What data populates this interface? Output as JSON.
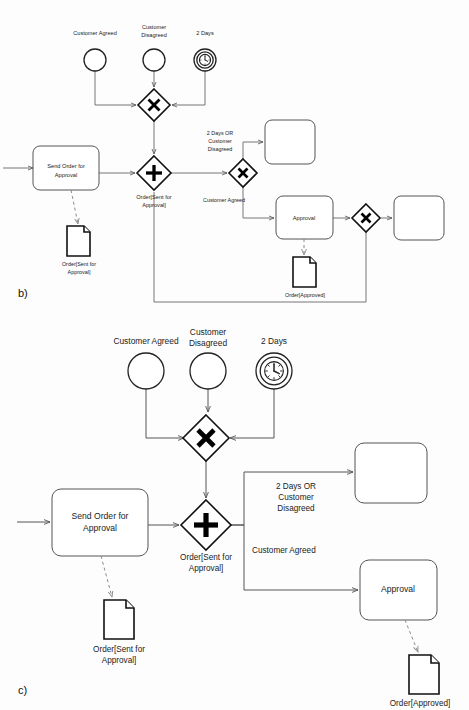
{
  "page": {
    "background_color": "#fdfdfd",
    "stroke_color": "#555555",
    "accent_color": "#111111"
  },
  "figures": [
    {
      "id": "b",
      "caption": "b)",
      "scale": "small",
      "events": [
        {
          "name": "customer-agreed-event",
          "label": "Customer Agreed",
          "type": "none",
          "cx": 95,
          "cy": 60,
          "r": 11,
          "label_x": 95,
          "label_y": 34
        },
        {
          "name": "customer-disagreed-event",
          "label_line1": "Customer",
          "label_line2": "Disagreed",
          "type": "none",
          "cx": 154,
          "cy": 60,
          "r": 11,
          "label_x": 154,
          "label_y": 28
        },
        {
          "name": "two-days-timer-event",
          "label": "2 Days",
          "type": "timer",
          "cx": 205,
          "cy": 60,
          "r": 11,
          "label_x": 205,
          "label_y": 34
        }
      ],
      "gateways": [
        {
          "name": "merge-xor-gateway",
          "type": "exclusive",
          "cx": 154,
          "cy": 105,
          "half": 16
        },
        {
          "name": "split-and-gateway",
          "type": "parallel",
          "cx": 154,
          "cy": 173,
          "half": 17,
          "label_line1": "Order[Sent for",
          "label_line2": "Approval]",
          "label_x": 154,
          "label_y": 194
        },
        {
          "name": "decision-xor-gateway",
          "type": "exclusive",
          "cx": 243,
          "cy": 173,
          "half": 14
        },
        {
          "name": "join-xor-gateway",
          "type": "exclusive",
          "cx": 366,
          "cy": 218,
          "half": 14
        }
      ],
      "tasks": [
        {
          "name": "send-order-task",
          "label_line1": "Send Order for",
          "label_line2": "Approval",
          "x": 33,
          "y": 146,
          "w": 66,
          "h": 44
        },
        {
          "name": "approval-task",
          "label": "Approval",
          "x": 276,
          "y": 196,
          "w": 57,
          "h": 43
        },
        {
          "name": "empty-task-top",
          "label": "",
          "x": 265,
          "y": 120,
          "w": 50,
          "h": 44
        },
        {
          "name": "empty-task-right",
          "label": "",
          "x": 394,
          "y": 196,
          "w": 50,
          "h": 44
        }
      ],
      "documents": [
        {
          "name": "order-sent-document",
          "label_line1": "Order[Sent for",
          "label_line2": "Approval]",
          "x": 67,
          "y": 226,
          "w": 23,
          "h": 30,
          "label_x": 79,
          "label_y": 265
        },
        {
          "name": "order-approved-document",
          "label": "Order[Approved]",
          "x": 293,
          "y": 257,
          "w": 23,
          "h": 30,
          "label_x": 305,
          "label_y": 295
        }
      ],
      "flow_labels": [
        {
          "name": "flow-label-two-days-or-disagreed",
          "line1": "2 Days OR",
          "line2": "Customer",
          "line3": "Disagreed",
          "x": 220,
          "y": 134
        },
        {
          "name": "flow-label-customer-agreed",
          "text": "Customer Agreed",
          "x": 221,
          "y": 200
        }
      ]
    },
    {
      "id": "c",
      "caption": "c)",
      "scale": "large",
      "events": [
        {
          "name": "customer-agreed-event",
          "label": "Customer Agreed",
          "type": "none",
          "cx": 146,
          "cy": 371,
          "r": 18,
          "label_x": 146,
          "label_y": 342
        },
        {
          "name": "customer-disagreed-event",
          "label_line1": "Customer",
          "label_line2": "Disagreed",
          "type": "none",
          "cx": 208,
          "cy": 371,
          "r": 18,
          "label_x": 208,
          "label_y": 334
        },
        {
          "name": "two-days-timer-event",
          "label": "2 Days",
          "type": "timer",
          "cx": 274,
          "cy": 371,
          "r": 18,
          "label_x": 274,
          "label_y": 342
        }
      ],
      "gateways": [
        {
          "name": "merge-xor-gateway",
          "type": "exclusive",
          "cx": 206,
          "cy": 438,
          "half": 23
        },
        {
          "name": "split-and-gateway",
          "type": "parallel",
          "cx": 206,
          "cy": 525,
          "half": 25,
          "label_line1": "Order[Sent for",
          "label_line2": "Approval]",
          "label_x": 206,
          "label_y": 554
        }
      ],
      "tasks": [
        {
          "name": "send-order-task",
          "label_line1": "Send Order for",
          "label_line2": "Approval",
          "x": 52,
          "y": 489,
          "w": 96,
          "h": 67
        },
        {
          "name": "approval-task",
          "label": "Approval",
          "x": 360,
          "y": 560,
          "w": 77,
          "h": 60
        },
        {
          "name": "empty-task-top",
          "label": "",
          "x": 355,
          "y": 443,
          "w": 72,
          "h": 60
        }
      ],
      "documents": [
        {
          "name": "order-sent-document",
          "label_line1": "Order[Sent for",
          "label_line2": "Approval]",
          "x": 104,
          "y": 600,
          "w": 30,
          "h": 39,
          "label_x": 119,
          "label_y": 650
        },
        {
          "name": "order-approved-document",
          "label": "Order[Approved]",
          "x": 409,
          "y": 655,
          "w": 30,
          "h": 39,
          "label_x": 424,
          "label_y": 704
        }
      ],
      "flow_labels": [
        {
          "name": "flow-label-two-days-or-disagreed",
          "line1": "2 Days OR",
          "line2": "Customer",
          "line3": "Disagreed",
          "x": 296,
          "y": 490
        },
        {
          "name": "flow-label-customer-agreed",
          "text": "Customer Agreed",
          "x": 255,
          "y": 551
        }
      ]
    }
  ],
  "icons": {
    "timer": "clock-icon",
    "exclusive_gateway": "x-mark-icon",
    "parallel_gateway": "plus-mark-icon",
    "document": "document-icon"
  }
}
